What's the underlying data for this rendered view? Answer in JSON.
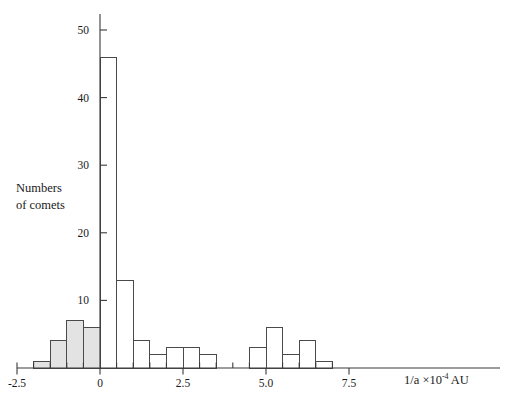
{
  "chart_data": {
    "type": "bar",
    "title": "",
    "subtitle": "",
    "xlabel": "1/a ×10⁻⁴ AU",
    "xlabel_parts": {
      "base": "1/a ×10",
      "exponent": "-4",
      "unit": "AU"
    },
    "ylabel": "Numbers of comets",
    "ylabel_line1": "Numbers",
    "ylabel_line2": "of comets",
    "xlim": [
      -2.5,
      8.5
    ],
    "ylim": [
      0,
      52
    ],
    "xticks": [
      -2.5,
      0,
      2.5,
      5.0,
      7.5
    ],
    "xticklabels": [
      "-2.5",
      "0",
      "2.5",
      "5.0",
      "7.5"
    ],
    "yticks": [
      10,
      20,
      30,
      40,
      50
    ],
    "yticklabels": [
      "10",
      "20",
      "30",
      "40",
      "50"
    ],
    "minor_xticks": [
      -2.0,
      -1.5,
      -1.0,
      -0.5,
      0.5,
      1.0,
      1.5,
      2.0,
      3.0,
      3.5,
      4.0,
      4.5,
      5.5,
      6.0,
      6.5,
      7.0
    ],
    "grid": false,
    "legend_position": "none",
    "bin_width": 0.5,
    "bins": [
      {
        "x0": -2.5,
        "x1": -2.0,
        "value": 0,
        "shaded": false
      },
      {
        "x0": -2.0,
        "x1": -1.5,
        "value": 1,
        "shaded": true
      },
      {
        "x0": -1.5,
        "x1": -1.0,
        "value": 4,
        "shaded": true
      },
      {
        "x0": -1.0,
        "x1": -0.5,
        "value": 7,
        "shaded": true
      },
      {
        "x0": -0.5,
        "x1": 0.0,
        "value": 6,
        "shaded": true
      },
      {
        "x0": 0.0,
        "x1": 0.5,
        "value": 46,
        "shaded": false
      },
      {
        "x0": 0.5,
        "x1": 1.0,
        "value": 13,
        "shaded": false
      },
      {
        "x0": 1.0,
        "x1": 1.5,
        "value": 4,
        "shaded": false
      },
      {
        "x0": 1.5,
        "x1": 2.0,
        "value": 2,
        "shaded": false
      },
      {
        "x0": 2.0,
        "x1": 2.5,
        "value": 3,
        "shaded": false
      },
      {
        "x0": 2.5,
        "x1": 3.0,
        "value": 3,
        "shaded": false
      },
      {
        "x0": 3.0,
        "x1": 3.5,
        "value": 2,
        "shaded": false
      },
      {
        "x0": 3.5,
        "x1": 4.0,
        "value": 0,
        "shaded": false
      },
      {
        "x0": 4.0,
        "x1": 4.5,
        "value": 0,
        "shaded": false
      },
      {
        "x0": 4.5,
        "x1": 5.0,
        "value": 3,
        "shaded": false
      },
      {
        "x0": 5.0,
        "x1": 5.5,
        "value": 6,
        "shaded": false
      },
      {
        "x0": 5.5,
        "x1": 6.0,
        "value": 2,
        "shaded": false
      },
      {
        "x0": 6.0,
        "x1": 6.5,
        "value": 4,
        "shaded": false
      },
      {
        "x0": 6.5,
        "x1": 7.0,
        "value": 1,
        "shaded": false
      }
    ],
    "colors": {
      "shaded_fill": "#e3e3e3",
      "unshaded_fill": "#ffffff",
      "bar_stroke": "#4a4a4a",
      "axis": "#3a3a3a",
      "text": "#1a1a1a"
    }
  }
}
